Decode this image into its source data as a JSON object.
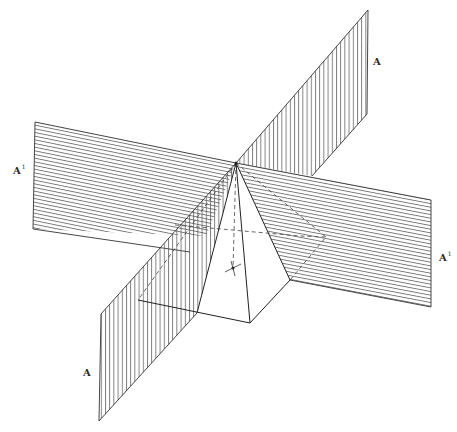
{
  "figure": {
    "labels": {
      "plane_a_top": "A",
      "plane_a_bottom": "A",
      "plane_a1_left": "A",
      "plane_a1_right": "A",
      "prime_mark": "1"
    },
    "colors": {
      "ink": "#333333",
      "hatch": "#555555",
      "background": "#ffffff"
    },
    "geometry": {
      "apex": [
        236,
        163
      ],
      "plane_a": {
        "hatch": "vertical",
        "upper_quad": [
          [
            236,
            163
          ],
          [
            368,
            10
          ],
          [
            367,
            114
          ],
          [
            312,
            176
          ]
        ],
        "lower_quad": [
          [
            236,
            163
          ],
          [
            101,
            314
          ],
          [
            99,
            421
          ],
          [
            208,
            297
          ]
        ]
      },
      "plane_a1": {
        "hatch": "horizontal",
        "left_quad": [
          [
            35,
            122
          ],
          [
            236,
            163
          ],
          [
            224,
            196
          ],
          [
            33,
            229
          ]
        ],
        "right_quad": [
          [
            236,
            163
          ],
          [
            431,
            200
          ],
          [
            431,
            307
          ],
          [
            290,
            270
          ]
        ]
      },
      "pyramid": {
        "base_left": [
          138,
          300
        ],
        "base_front": [
          250,
          323
        ],
        "base_right": [
          290,
          280
        ],
        "base_back": [
          326,
          237
        ],
        "base_front_left": [
          197,
          313
        ],
        "center_mark": [
          233,
          268
        ]
      }
    }
  }
}
